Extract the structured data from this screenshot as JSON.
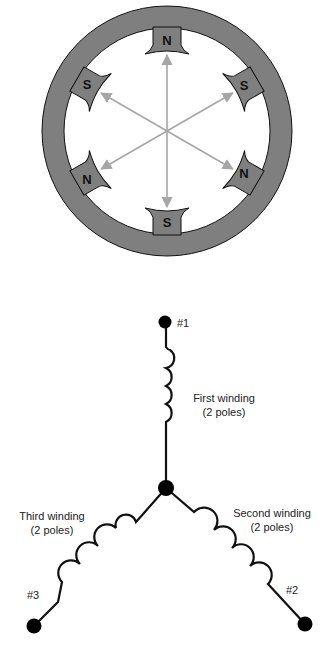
{
  "stator": {
    "ring_color": "#7f7f7f",
    "outline_color": "#111111",
    "arrow_color": "#a6a6a6",
    "poles": [
      {
        "position": "top",
        "label": "N",
        "angle": -90
      },
      {
        "position": "upper-right",
        "label": "S",
        "angle": -30
      },
      {
        "position": "lower-right",
        "label": "N",
        "angle": 30
      },
      {
        "position": "bottom",
        "label": "S",
        "angle": 90
      },
      {
        "position": "lower-left",
        "label": "N",
        "angle": 150
      },
      {
        "position": "upper-left",
        "label": "S",
        "angle": 210
      }
    ]
  },
  "wye_diagram": {
    "terminals": [
      {
        "id": "t1",
        "label": "#1"
      },
      {
        "id": "t2",
        "label": "#2"
      },
      {
        "id": "t3",
        "label": "#3"
      }
    ],
    "windings": [
      {
        "id": "first",
        "name": "First winding",
        "poles": "(2 poles)"
      },
      {
        "id": "second",
        "name": "Second winding",
        "poles": "(2 poles)"
      },
      {
        "id": "third",
        "name": "Third winding",
        "poles": "(2 poles)"
      }
    ]
  }
}
